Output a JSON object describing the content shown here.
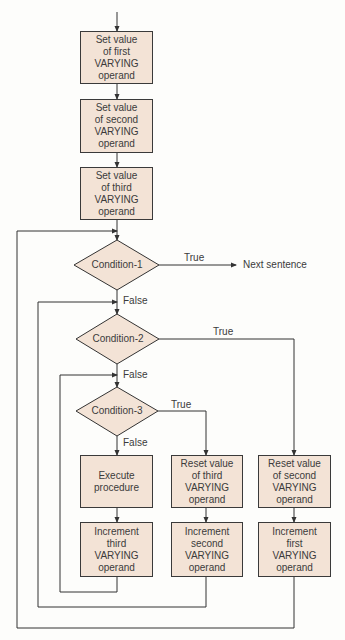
{
  "colors": {
    "box_fill": "#f3e3d6",
    "line": "#333333",
    "text": "#3b3b3b",
    "background": "#fdfdfb"
  },
  "flowchart": {
    "init_boxes": [
      {
        "text": "Set value\nof first\nVARYING\noperand"
      },
      {
        "text": "Set value\nof second\nVARYING\noperand"
      },
      {
        "text": "Set value\nof third\nVARYING\noperand"
      }
    ],
    "conditions": [
      {
        "label": "Condition-1",
        "true_label": "True",
        "false_label": "False",
        "true_target": "Next sentence"
      },
      {
        "label": "Condition-2",
        "true_label": "True",
        "false_label": "False"
      },
      {
        "label": "Condition-3",
        "true_label": "True",
        "false_label": "False"
      }
    ],
    "action_boxes": [
      {
        "text": "Execute\nprocedure"
      },
      {
        "text": "Reset value\nof third\nVARYING\noperand"
      },
      {
        "text": "Reset value\nof second\nVARYING\noperand"
      }
    ],
    "increment_boxes": [
      {
        "text": "Increment\nthird\nVARYING\noperand"
      },
      {
        "text": "Increment\nsecond\nVARYING\noperand"
      },
      {
        "text": "Increment\nfirst\nVARYING\noperand"
      }
    ]
  }
}
